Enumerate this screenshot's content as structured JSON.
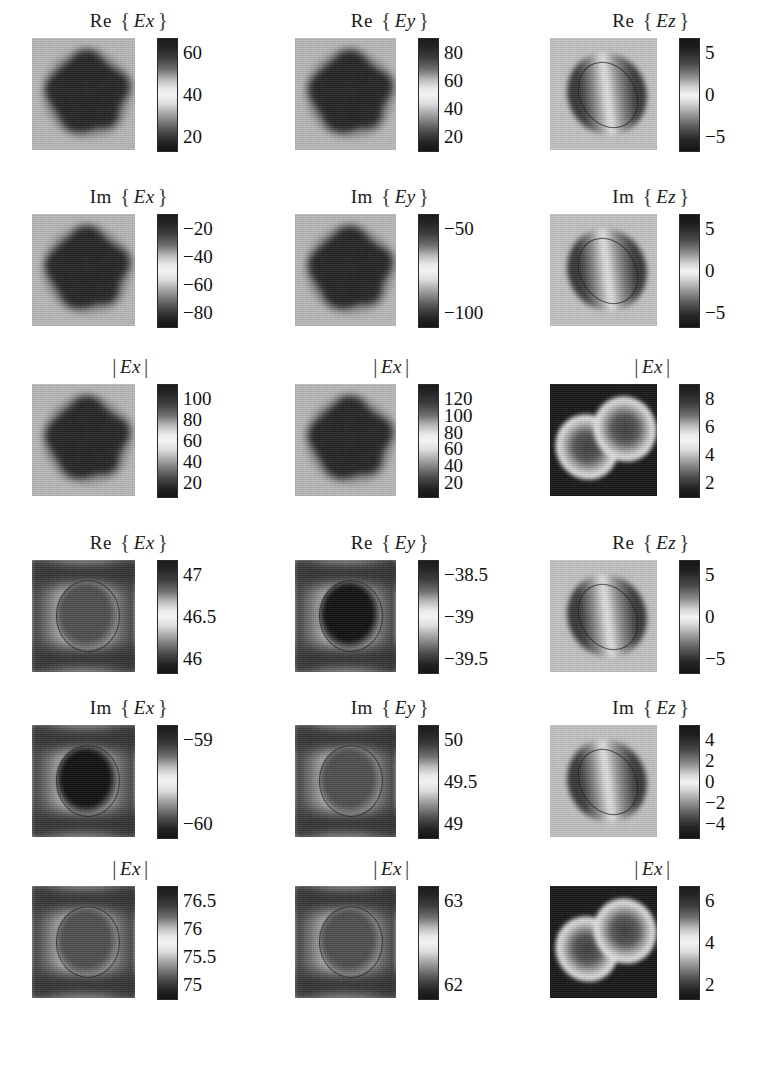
{
  "figure": {
    "type": "image-grid",
    "rows": 6,
    "cols": 3,
    "colormap": "grayscale"
  },
  "chart_data": {
    "type": "heatmap",
    "title": "",
    "xlabel": "",
    "ylabel": "",
    "grid": false,
    "legend": "colorbar-right-of-each-panel",
    "panels": [
      {
        "id": "r1c1",
        "row": 1,
        "col": 1,
        "prefix": "Re",
        "component": "Ex",
        "bracket": "braces",
        "ticks": [
          "60",
          "40",
          "20"
        ],
        "tick_values": [
          60,
          40,
          20
        ],
        "clim": [
          10,
          70
        ],
        "shape": "star-blob"
      },
      {
        "id": "r1c2",
        "row": 1,
        "col": 2,
        "prefix": "Re",
        "component": "Ey",
        "bracket": "braces",
        "ticks": [
          "80",
          "60",
          "40",
          "20"
        ],
        "tick_values": [
          80,
          60,
          40,
          20
        ],
        "clim": [
          10,
          90
        ],
        "shape": "star-blob"
      },
      {
        "id": "r1c3",
        "row": 1,
        "col": 3,
        "prefix": "Re",
        "component": "Ez",
        "bracket": "braces",
        "ticks": [
          "5",
          "0",
          "-5"
        ],
        "tick_values": [
          5,
          0,
          -5
        ],
        "clim": [
          -7,
          7
        ],
        "shape": "tilted-dipole"
      },
      {
        "id": "r2c1",
        "row": 2,
        "col": 1,
        "prefix": "Im",
        "component": "Ex",
        "bracket": "braces",
        "ticks": [
          "-20",
          "-40",
          "-60",
          "-80"
        ],
        "tick_values": [
          -20,
          -40,
          -60,
          -80
        ],
        "clim": [
          -90,
          -10
        ],
        "shape": "star-blob"
      },
      {
        "id": "r2c2",
        "row": 2,
        "col": 2,
        "prefix": "Im",
        "component": "Ey",
        "bracket": "braces",
        "ticks": [
          "-50",
          "-100"
        ],
        "tick_values": [
          -50,
          -100
        ],
        "clim": [
          -115,
          -20
        ],
        "shape": "star-blob"
      },
      {
        "id": "r2c3",
        "row": 2,
        "col": 3,
        "prefix": "Im",
        "component": "Ez",
        "bracket": "braces",
        "ticks": [
          "5",
          "0",
          "-5"
        ],
        "tick_values": [
          5,
          0,
          -5
        ],
        "clim": [
          -6,
          6
        ],
        "shape": "tilted-dipole"
      },
      {
        "id": "r3c1",
        "row": 3,
        "col": 1,
        "prefix": "",
        "component": "Ex",
        "bracket": "bars",
        "ticks": [
          "100",
          "80",
          "60",
          "40",
          "20"
        ],
        "tick_values": [
          100,
          80,
          60,
          40,
          20
        ],
        "clim": [
          5,
          115
        ],
        "shape": "star-blob"
      },
      {
        "id": "r3c2",
        "row": 3,
        "col": 2,
        "prefix": "",
        "component": "Ex",
        "bracket": "bars",
        "ticks": [
          "120",
          "100",
          "80",
          "60",
          "40",
          "20"
        ],
        "tick_values": [
          120,
          100,
          80,
          60,
          40,
          20
        ],
        "clim": [
          5,
          135
        ],
        "shape": "star-blob"
      },
      {
        "id": "r3c3",
        "row": 3,
        "col": 3,
        "prefix": "",
        "component": "Ex",
        "bracket": "bars",
        "ticks": [
          "8",
          "6",
          "4",
          "2"
        ],
        "tick_values": [
          8,
          6,
          4,
          2
        ],
        "clim": [
          0,
          9
        ],
        "shape": "double-crescent"
      },
      {
        "id": "r4c1",
        "row": 4,
        "col": 1,
        "prefix": "Re",
        "component": "Ex",
        "bracket": "braces",
        "ticks": [
          "47",
          "46.5",
          "46"
        ],
        "tick_values": [
          47,
          46.5,
          46
        ],
        "clim": [
          45.8,
          47.2
        ],
        "shape": "ring-sphere"
      },
      {
        "id": "r4c2",
        "row": 4,
        "col": 2,
        "prefix": "Re",
        "component": "Ey",
        "bracket": "braces",
        "ticks": [
          "-38.5",
          "-39",
          "-39.5"
        ],
        "tick_values": [
          -38.5,
          -39,
          -39.5
        ],
        "clim": [
          -39.7,
          -38.3
        ],
        "shape": "ring-sphere-dark-core"
      },
      {
        "id": "r4c3",
        "row": 4,
        "col": 3,
        "prefix": "Re",
        "component": "Ez",
        "bracket": "braces",
        "ticks": [
          "5",
          "0",
          "-5"
        ],
        "tick_values": [
          5,
          0,
          -5
        ],
        "clim": [
          -7,
          7
        ],
        "shape": "tilted-dipole"
      },
      {
        "id": "r5c1",
        "row": 5,
        "col": 1,
        "prefix": "Im",
        "component": "Ex",
        "bracket": "braces",
        "ticks": [
          "-59",
          "-60"
        ],
        "tick_values": [
          -59,
          -60
        ],
        "clim": [
          -60.4,
          -58.6
        ],
        "shape": "ring-sphere-dark-core"
      },
      {
        "id": "r5c2",
        "row": 5,
        "col": 2,
        "prefix": "Im",
        "component": "Ey",
        "bracket": "braces",
        "ticks": [
          "50",
          "49.5",
          "49"
        ],
        "tick_values": [
          50,
          49.5,
          49
        ],
        "clim": [
          48.7,
          50.3
        ],
        "shape": "ring-sphere"
      },
      {
        "id": "r5c3",
        "row": 5,
        "col": 3,
        "prefix": "Im",
        "component": "Ez",
        "bracket": "braces",
        "ticks": [
          "4",
          "2",
          "0",
          "-2",
          "-4"
        ],
        "tick_values": [
          4,
          2,
          0,
          -2,
          -4
        ],
        "clim": [
          -5,
          5
        ],
        "shape": "tilted-dipole"
      },
      {
        "id": "r6c1",
        "row": 6,
        "col": 1,
        "prefix": "",
        "component": "Ex",
        "bracket": "bars",
        "ticks": [
          "76.5",
          "76",
          "75.5",
          "75"
        ],
        "tick_values": [
          76.5,
          76,
          75.5,
          75
        ],
        "clim": [
          74.7,
          76.8
        ],
        "shape": "ring-sphere"
      },
      {
        "id": "r6c2",
        "row": 6,
        "col": 2,
        "prefix": "",
        "component": "Ex",
        "bracket": "bars",
        "ticks": [
          "63",
          "62"
        ],
        "tick_values": [
          63,
          62
        ],
        "clim": [
          61.5,
          63.6
        ],
        "shape": "ring-sphere"
      },
      {
        "id": "r6c3",
        "row": 6,
        "col": 3,
        "prefix": "",
        "component": "Ex",
        "bracket": "bars",
        "ticks": [
          "6",
          "4",
          "2"
        ],
        "tick_values": [
          6,
          4,
          2
        ],
        "clim": [
          0,
          7
        ],
        "shape": "double-crescent"
      }
    ]
  }
}
